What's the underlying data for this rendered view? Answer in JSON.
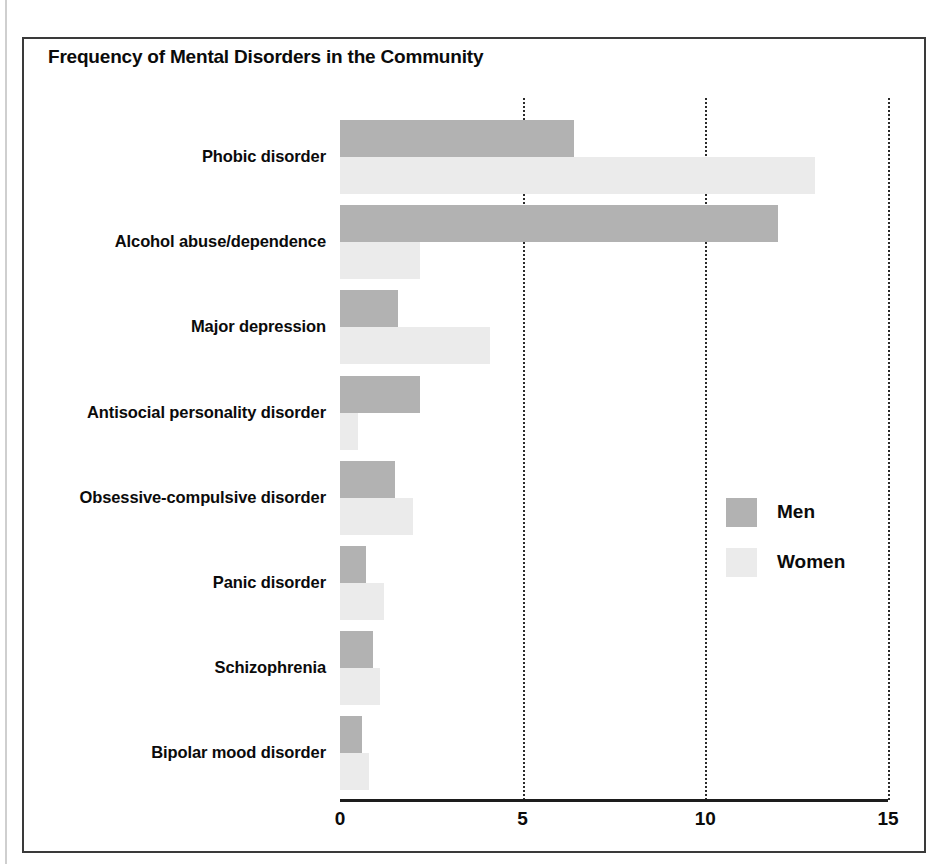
{
  "figure": {
    "title": "Frequency of Mental Disorders in the Community"
  },
  "legend": {
    "items": [
      {
        "label": "Men",
        "color": "#b2b2b2"
      },
      {
        "label": "Women",
        "color": "#ebebeb"
      }
    ]
  },
  "axis": {
    "ticks": [
      "0",
      "5",
      "10",
      "15"
    ]
  },
  "chart_data": {
    "type": "bar",
    "orientation": "horizontal",
    "title": "Frequency of Mental Disorders in the Community",
    "xlabel": "",
    "ylabel": "",
    "xlim": [
      0,
      15
    ],
    "xticks": [
      0,
      5,
      10,
      15
    ],
    "grid": "vertical dotted gridlines at 5, 10, 15",
    "legend_position": "inside right, middle",
    "categories": [
      "Phobic disorder",
      "Alcohol abuse/dependence",
      "Major depression",
      "Antisocial personality disorder",
      "Obsessive-compulsive disorder",
      "Panic disorder",
      "Schizophrenia",
      "Bipolar mood disorder"
    ],
    "series": [
      {
        "name": "Men",
        "color": "#b2b2b2",
        "values": [
          6.4,
          12.0,
          1.6,
          2.2,
          1.5,
          0.7,
          0.9,
          0.6
        ]
      },
      {
        "name": "Women",
        "color": "#ebebeb",
        "values": [
          13.0,
          2.2,
          4.1,
          0.5,
          2.0,
          1.2,
          1.1,
          0.8
        ]
      }
    ]
  }
}
